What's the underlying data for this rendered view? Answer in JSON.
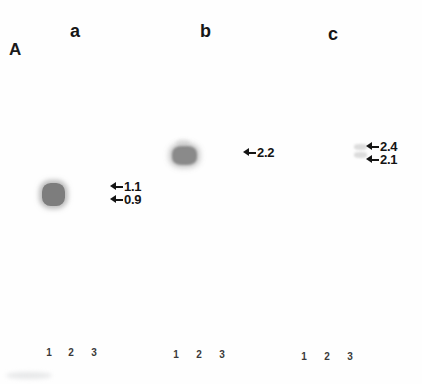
{
  "figure": {
    "panel_label": "A",
    "background_color": "#fefefe",
    "ink_color": "#141414"
  },
  "columns": [
    {
      "label": "a",
      "lanes": [
        "1",
        "2",
        "3"
      ]
    },
    {
      "label": "b",
      "lanes": [
        "1",
        "2",
        "3"
      ]
    },
    {
      "label": "c",
      "lanes": [
        "1",
        "2",
        "3"
      ]
    }
  ],
  "markers": {
    "column_a": [
      {
        "value": "1.1",
        "icon": "arrow-left-icon"
      },
      {
        "value": "0.9",
        "icon": "arrow-left-icon"
      }
    ],
    "column_b": [
      {
        "value": "2.2",
        "icon": "arrow-left-icon"
      }
    ],
    "column_c": [
      {
        "value": "2.4",
        "icon": "arrow-left-icon"
      },
      {
        "value": "2.1",
        "icon": "arrow-left-icon"
      }
    ]
  },
  "bands": {
    "a_lane1": {
      "intensity": "strong"
    },
    "b_lane1": {
      "intensity": "medium"
    },
    "c_lane1_upper": {
      "intensity": "faint"
    },
    "c_lane1_lower": {
      "intensity": "faint"
    }
  }
}
